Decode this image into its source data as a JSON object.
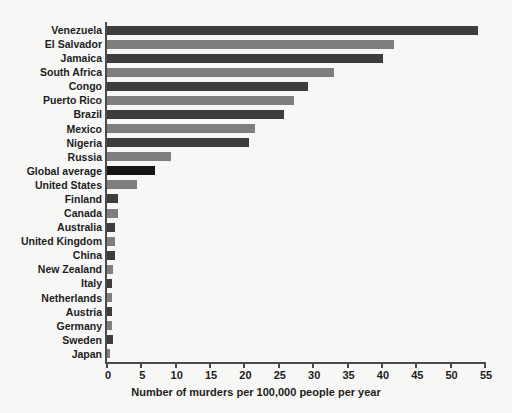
{
  "chart_data": {
    "type": "bar",
    "orientation": "horizontal",
    "title": "",
    "xlabel": "Number of murders per 100,000 people per year",
    "ylabel": "",
    "xlim": [
      0,
      55
    ],
    "xticks": [
      0,
      5,
      10,
      15,
      20,
      25,
      30,
      35,
      40,
      45,
      50,
      55
    ],
    "grid": false,
    "legend": null,
    "categories": [
      "Venezuela",
      "El Salvador",
      "Jamaica",
      "South Africa",
      "Congo",
      "Puerto Rico",
      "Brazil",
      "Mexico",
      "Nigeria",
      "Russia",
      "Global average",
      "United States",
      "Finland",
      "Canada",
      "Australia",
      "United Kingdom",
      "China",
      "New Zealand",
      "Italy",
      "Netherlands",
      "Austria",
      "Germany",
      "Sweden",
      "Japan"
    ],
    "values": [
      54.0,
      41.7,
      40.2,
      33.0,
      29.3,
      27.2,
      25.8,
      21.6,
      20.6,
      9.3,
      7.0,
      4.3,
      1.6,
      1.6,
      1.2,
      1.1,
      1.1,
      0.9,
      0.8,
      0.8,
      0.8,
      0.8,
      0.9,
      0.4
    ],
    "bar_colors": [
      "#3d3d3d",
      "#7e7e7e",
      "#3d3d3d",
      "#7e7e7e",
      "#3d3d3d",
      "#7e7e7e",
      "#3d3d3d",
      "#7e7e7e",
      "#3d3d3d",
      "#7e7e7e",
      "#151515",
      "#7e7e7e",
      "#3d3d3d",
      "#7e7e7e",
      "#3d3d3d",
      "#7e7e7e",
      "#3d3d3d",
      "#7e7e7e",
      "#3d3d3d",
      "#7e7e7e",
      "#3d3d3d",
      "#7e7e7e",
      "#3d3d3d",
      "#7e7e7e"
    ]
  },
  "colors": {
    "background": "#f7f7f5",
    "axis": "#4a4a4a",
    "text": "#1d1d1d",
    "bar_dark": "#3d3d3d",
    "bar_light": "#7e7e7e",
    "bar_highlight": "#151515"
  }
}
